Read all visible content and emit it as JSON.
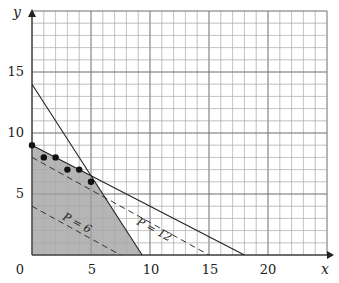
{
  "chart_data": {
    "type": "line",
    "title": "",
    "xlabel": "x",
    "ylabel": "y",
    "xlim": [
      0,
      25
    ],
    "ylim": [
      0,
      20
    ],
    "grid": true,
    "grid_minor_step": 1,
    "x_ticks": [
      0,
      5,
      10,
      15,
      20
    ],
    "y_ticks": [
      5,
      10,
      15
    ],
    "origin_label": "0",
    "constraints": [
      {
        "name": "constraint-1",
        "equation": "3x + 2y = 28",
        "points": [
          [
            0,
            14
          ],
          [
            9.333,
            0
          ]
        ],
        "style": "solid"
      },
      {
        "name": "constraint-2",
        "equation": "x + 2y = 18",
        "points": [
          [
            0,
            9
          ],
          [
            18,
            0
          ]
        ],
        "style": "solid"
      }
    ],
    "feasible_region": {
      "vertices": [
        [
          0,
          0
        ],
        [
          0,
          9
        ],
        [
          5,
          6.5
        ],
        [
          9.333,
          0
        ]
      ],
      "fill": "#a8a8a8"
    },
    "objective_lines": [
      {
        "label": "P = 6",
        "points": [
          [
            0,
            4
          ],
          [
            7.5,
            0
          ]
        ],
        "style": "dashed"
      },
      {
        "label": "P = 12",
        "points": [
          [
            0,
            8
          ],
          [
            15,
            0
          ]
        ],
        "style": "dashed"
      }
    ],
    "integer_points": [
      [
        0,
        9
      ],
      [
        1,
        8
      ],
      [
        2,
        8
      ],
      [
        3,
        7
      ],
      [
        4,
        7
      ],
      [
        5,
        6
      ]
    ]
  },
  "labels": {
    "x_axis": "x",
    "y_axis": "y",
    "origin": "0",
    "xt5": "5",
    "xt10": "10",
    "xt15": "15",
    "xt20": "20",
    "yt5": "5",
    "yt10": "10",
    "yt15": "15",
    "p6": "P = 6",
    "p12": "P = 12"
  }
}
